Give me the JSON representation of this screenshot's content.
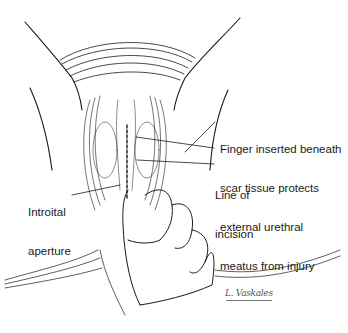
{
  "figure": {
    "background": "#ffffff",
    "line_color": "#1a1a1a",
    "labels": [
      {
        "id": "finger",
        "lines": [
          "Finger inserted beneath",
          "scar tissue protects",
          "external urethral",
          "meatus from injury"
        ]
      },
      {
        "id": "incision",
        "lines": [
          "Line of",
          "incision"
        ]
      },
      {
        "id": "introitus",
        "lines": [
          "Introital",
          "aperture"
        ]
      }
    ],
    "signature": "L. Vaskales"
  }
}
